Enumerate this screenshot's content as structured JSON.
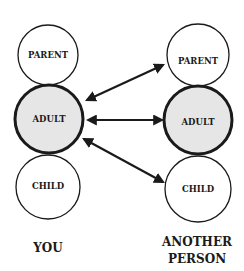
{
  "diagram": {
    "columns": [
      {
        "label_lines": [
          "YOU"
        ],
        "states": [
          {
            "label": "PARENT",
            "highlighted": false
          },
          {
            "label": "ADULT",
            "highlighted": true
          },
          {
            "label": "CHILD",
            "highlighted": false
          }
        ]
      },
      {
        "label_lines": [
          "ANOTHER",
          "PERSON"
        ],
        "states": [
          {
            "label": "PARENT",
            "highlighted": false
          },
          {
            "label": "ADULT",
            "highlighted": true
          },
          {
            "label": "CHILD",
            "highlighted": false
          }
        ]
      }
    ],
    "arrows": [
      {
        "from": "YOU.ADULT",
        "to": "ANOTHER PERSON.PARENT",
        "direction": "bidirectional"
      },
      {
        "from": "YOU.ADULT",
        "to": "ANOTHER PERSON.ADULT",
        "direction": "bidirectional"
      },
      {
        "from": "YOU.ADULT",
        "to": "ANOTHER PERSON.CHILD",
        "direction": "bidirectional"
      }
    ],
    "colors": {
      "stroke": "#1a1a1a",
      "highlight_fill": "#e6e6e6",
      "background": "#ffffff"
    }
  }
}
